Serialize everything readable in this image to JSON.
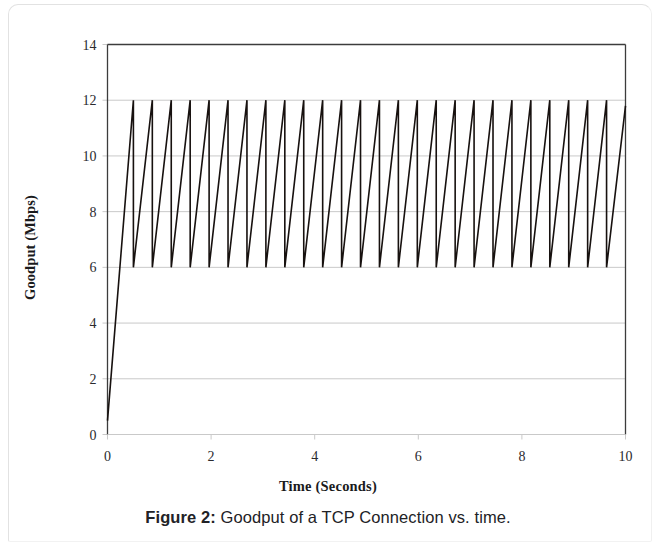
{
  "figure": {
    "caption_label": "Figure 2:",
    "caption_text": " Goodput of a TCP Connection vs. time."
  },
  "chart_data": {
    "type": "line",
    "title": "",
    "xlabel": "Time (Seconds)",
    "ylabel": "Goodput (Mbps)",
    "xlim": [
      0,
      10
    ],
    "ylim": [
      0,
      14
    ],
    "xticks": [
      0,
      2,
      4,
      6,
      8,
      10
    ],
    "xtick_labels": [
      "0",
      "2",
      "4",
      "6",
      "8",
      "10"
    ],
    "yticks": [
      0,
      2,
      4,
      6,
      8,
      10,
      12,
      14
    ],
    "ytick_labels": [
      "0",
      "2",
      "4",
      "6",
      "8",
      "10",
      "12",
      "14"
    ],
    "grid": "horizontal",
    "grid_color": "#c9c9c9",
    "frame_color": "#3c3c3c",
    "line_color": "#17110f",
    "line_width": 1.6,
    "legend": null,
    "annotations": [],
    "peak_value": 12,
    "trough_value": 6,
    "start_value": 0.5,
    "ramp_end_time": 0.5,
    "period": 0.3654,
    "cycle_count": 26,
    "series": [
      {
        "name": "Goodput",
        "x": [
          0,
          0.5,
          0.5,
          0.8654,
          0.8654,
          1.2308,
          1.2308,
          1.5962,
          1.5962,
          1.9615,
          1.9615,
          2.3269,
          2.3269,
          2.6923,
          2.6923,
          3.0577,
          3.0577,
          3.4231,
          3.4231,
          3.7885,
          3.7885,
          4.1538,
          4.1538,
          4.5192,
          4.5192,
          4.8846,
          4.8846,
          5.25,
          5.25,
          5.6154,
          5.6154,
          5.9808,
          5.9808,
          6.3462,
          6.3462,
          6.7115,
          6.7115,
          7.0769,
          7.0769,
          7.4423,
          7.4423,
          7.8077,
          7.8077,
          8.1731,
          8.1731,
          8.5385,
          8.5385,
          8.9038,
          8.9038,
          9.2692,
          9.2692,
          9.6346,
          9.6346,
          10
        ],
        "y": [
          0.5,
          12,
          6,
          12,
          6,
          12,
          6,
          12,
          6,
          12,
          6,
          12,
          6,
          12,
          6,
          12,
          6,
          12,
          6,
          12,
          6,
          12,
          6,
          12,
          6,
          12,
          6,
          12,
          6,
          12,
          6,
          12,
          6,
          12,
          6,
          12,
          6,
          12,
          6,
          12,
          6,
          12,
          6,
          12,
          6,
          12,
          6,
          12,
          6,
          12,
          6,
          12,
          6,
          11.8
        ]
      }
    ]
  }
}
